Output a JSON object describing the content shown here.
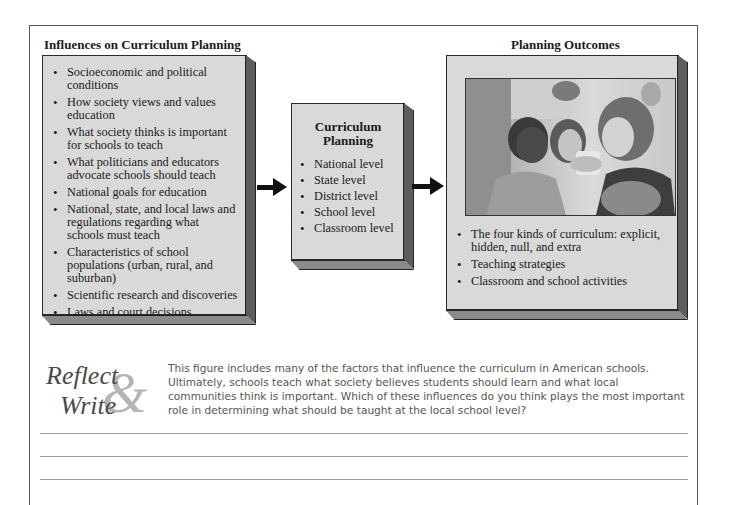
{
  "left_panel": {
    "title": "Influences on Curriculum Planning",
    "items": [
      "Socioeconomic and political conditions",
      "How society views and values education",
      "What society thinks is important for schools to teach",
      "What politicians and educators advocate schools should teach",
      "National goals for education",
      "National, state, and local laws and regulations regarding what schools must teach",
      "Characteristics of school populations (urban, rural, and suburban)",
      "Scientific research and discoveries",
      "Laws and court decisions"
    ]
  },
  "middle_panel": {
    "title": "Curriculum Planning",
    "items": [
      "National level",
      "State level",
      "District level",
      "School level",
      "Classroom level"
    ]
  },
  "right_panel": {
    "title": "Planning Outcomes",
    "photo_description": "Teacher showing an object to two students in a classroom",
    "items": [
      "The four kinds of curriculum: explicit, hidden, null, and extra",
      "Teaching strategies",
      "Classroom and school activities"
    ]
  },
  "arrows": [
    "arrow-right",
    "arrow-right"
  ],
  "reflect": {
    "logo_line1": "Reflect",
    "logo_amp": "&",
    "logo_line2": "Write",
    "prompt": "This figure includes many of the factors that influence the curriculum in American schools. Ultimately, schools teach what society believes students should learn and what local communities think is important. Which of these influences do you think plays the most important role in determining what should be taught at the local school level?",
    "writing_lines": 3
  },
  "colors": {
    "box_fill": "#d9d9d9",
    "box_side": "#5c5c5c",
    "frame": "#5a5a5a",
    "prompt_text": "#555555"
  }
}
